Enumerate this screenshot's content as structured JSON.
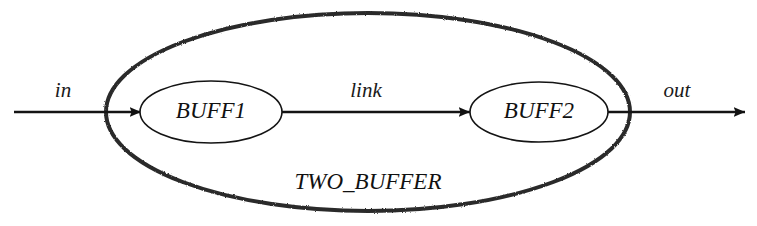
{
  "diagram": {
    "type": "block-diagram",
    "background_color": "#ffffff",
    "stroke_color": "#1a1a1a",
    "container": {
      "label": "TWO_BUFFER",
      "shape": "ellipse",
      "cx": 368,
      "cy": 112,
      "rx": 262,
      "ry": 99,
      "stroke_width": 4,
      "label_x": 368,
      "label_y": 184,
      "label_font_size": 23
    },
    "nodes": [
      {
        "id": "buff1",
        "label": "BUFF1",
        "shape": "ellipse",
        "cx": 211,
        "cy": 112,
        "rx": 71,
        "ry": 31,
        "stroke_width": 1.6,
        "label_font_size": 23
      },
      {
        "id": "buff2",
        "label": "BUFF2",
        "shape": "ellipse",
        "cx": 539,
        "cy": 112,
        "rx": 69,
        "ry": 30,
        "stroke_width": 1.6,
        "label_font_size": 23
      }
    ],
    "edges": [
      {
        "id": "in",
        "label": "in",
        "from": "external-input",
        "to": "buff1",
        "x1": 14,
        "x2": 141,
        "y": 112,
        "arrowhead": true,
        "label_x": 63,
        "label_y": 92,
        "label_font_size": 21
      },
      {
        "id": "link",
        "label": "link",
        "from": "buff1",
        "to": "buff2",
        "x1": 282,
        "x2": 470,
        "y": 112,
        "arrowhead": true,
        "label_x": 366,
        "label_y": 92,
        "label_font_size": 21
      },
      {
        "id": "out",
        "label": "out",
        "from": "buff2",
        "to": "external-output",
        "x1": 608,
        "x2": 745,
        "y": 112,
        "arrowhead": true,
        "label_x": 677,
        "label_y": 92,
        "label_font_size": 21
      }
    ]
  }
}
